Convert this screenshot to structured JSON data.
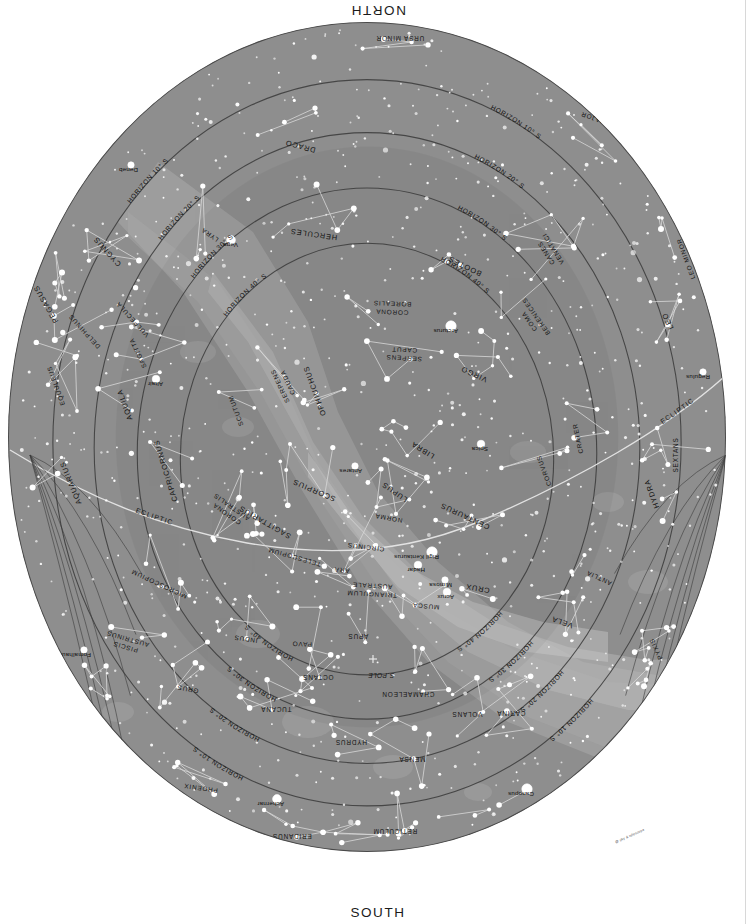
{
  "cardinals": {
    "north": "NORTH",
    "south": "SOUTH",
    "east": "EAST",
    "west": "WEST"
  },
  "credit": "@ sky & telescope",
  "colors": {
    "sky": "#8e8e8e",
    "sky_inner": "#7d7d7d",
    "milky_way": "#a9a9a9",
    "milky_way_bright": "#bdbdbd",
    "star": "#ffffff",
    "line": "#d8d8d8",
    "ring": "#3a3a3a",
    "text": "#141414",
    "background": "#ffffff"
  },
  "rings": [
    {
      "label": "HORIZON 10° S"
    },
    {
      "label": "HORIZON 20° S"
    },
    {
      "label": "HORIZON 30° S"
    },
    {
      "label": "HORIZON 40° S"
    }
  ],
  "pole": {
    "label": "S.POLE"
  },
  "ecliptic_label": "ECLIPTIC",
  "chart_data": {
    "type": "scatter",
    "projection": "azimuthal (all-sky, south pole centred)",
    "grid": "horizon altitude rings at 10°, 20°, 30°, 40° south",
    "cardinal_points": [
      "NORTH",
      "EAST",
      "SOUTH",
      "WEST"
    ],
    "horizon_rings_deg": [
      10,
      20,
      30,
      40
    ],
    "named_stars": [
      {
        "name": "Deneb",
        "x": 131,
        "y": 165,
        "mag": 1.25
      },
      {
        "name": "Vega",
        "x": 231,
        "y": 240,
        "mag": 0.03
      },
      {
        "name": "Altair",
        "x": 156,
        "y": 379,
        "mag": 0.77
      },
      {
        "name": "Arcturus",
        "x": 451,
        "y": 326,
        "mag": -0.05
      },
      {
        "name": "Regulus",
        "x": 703,
        "y": 372,
        "mag": 1.35
      },
      {
        "name": "Spica",
        "x": 481,
        "y": 444,
        "mag": 0.97
      },
      {
        "name": "Antares",
        "x": 355,
        "y": 466,
        "mag": 1.06
      },
      {
        "name": "Rigil Kentaurus",
        "x": 432,
        "y": 552,
        "mag": -0.27
      },
      {
        "name": "Hadar",
        "x": 418,
        "y": 565,
        "mag": 0.61
      },
      {
        "name": "Mimosa",
        "x": 445,
        "y": 580,
        "mag": 1.25
      },
      {
        "name": "Acrux",
        "x": 447,
        "y": 592,
        "mag": 0.77
      },
      {
        "name": "Fomalhaut",
        "x": 84,
        "y": 650,
        "mag": 1.16
      },
      {
        "name": "Achernar",
        "x": 277,
        "y": 799,
        "mag": 0.46
      },
      {
        "name": "Canopus",
        "x": 527,
        "y": 789,
        "mag": -0.74
      }
    ],
    "constellations": [
      {
        "name": "URSA MINOR",
        "x": 400,
        "y": 36,
        "rot": 180,
        "size": "sm"
      },
      {
        "name": "URSA MAJOR",
        "x": 605,
        "y": 120,
        "rot": 200,
        "size": "sm"
      },
      {
        "name": "DRACO",
        "x": 301,
        "y": 144,
        "rot": 195,
        "size": "md"
      },
      {
        "name": "CANES VENATICI",
        "x": 548,
        "y": 252,
        "rot": 238,
        "size": "sm"
      },
      {
        "name": "LEO MINOR",
        "x": 688,
        "y": 258,
        "rot": 250,
        "size": "sm"
      },
      {
        "name": "CYGNUS",
        "x": 109,
        "y": 250,
        "rot": 228,
        "size": "md"
      },
      {
        "name": "LYRA",
        "x": 211,
        "y": 233,
        "rot": 215,
        "size": "sm"
      },
      {
        "name": "HERCULES",
        "x": 314,
        "y": 232,
        "rot": 188,
        "size": "md"
      },
      {
        "name": "BOOTES",
        "x": 466,
        "y": 264,
        "rot": 206,
        "size": "md"
      },
      {
        "name": "CORONA BOREALIS",
        "x": 392,
        "y": 310,
        "rot": 182,
        "size": "sm"
      },
      {
        "name": "COMA BERENICES",
        "x": 531,
        "y": 320,
        "rot": 235,
        "size": "sm"
      },
      {
        "name": "LEO",
        "x": 670,
        "y": 320,
        "rot": 245,
        "size": "md"
      },
      {
        "name": "PEGASUS",
        "x": 48,
        "y": 303,
        "rot": 240,
        "size": "md"
      },
      {
        "name": "DELPHINUS",
        "x": 86,
        "y": 330,
        "rot": 228,
        "size": "sm"
      },
      {
        "name": "VULPECULA",
        "x": 134,
        "y": 318,
        "rot": 228,
        "size": "sm"
      },
      {
        "name": "SAGITTA",
        "x": 140,
        "y": 352,
        "rot": 245,
        "size": "sm"
      },
      {
        "name": "SERPENS CAPUT",
        "x": 404,
        "y": 356,
        "rot": 183,
        "size": "sm"
      },
      {
        "name": "OPHIUCHUS",
        "x": 317,
        "y": 390,
        "rot": 250,
        "size": "md"
      },
      {
        "name": "VIRGO",
        "x": 475,
        "y": 372,
        "rot": 205,
        "size": "md"
      },
      {
        "name": "EQUULEUS",
        "x": 58,
        "y": 385,
        "rot": 250,
        "size": "sm"
      },
      {
        "name": "AQUILA",
        "x": 127,
        "y": 404,
        "rot": 250,
        "size": "md"
      },
      {
        "name": "SCUTUM",
        "x": 238,
        "y": 410,
        "rot": 250,
        "size": "sm"
      },
      {
        "name": "SERPENS CAUDA",
        "x": 282,
        "y": 385,
        "rot": 245,
        "size": "sm"
      },
      {
        "name": "SEXTANS",
        "x": 678,
        "y": 455,
        "rot": 270,
        "size": "sm"
      },
      {
        "name": "CRATER",
        "x": 580,
        "y": 438,
        "rot": 258,
        "size": "sm"
      },
      {
        "name": "CORVUS",
        "x": 546,
        "y": 470,
        "rot": 250,
        "size": "sm"
      },
      {
        "name": "LIBRA",
        "x": 424,
        "y": 448,
        "rot": 212,
        "size": "md"
      },
      {
        "name": "LUPUS",
        "x": 396,
        "y": 490,
        "rot": 215,
        "size": "md"
      },
      {
        "name": "AQUARIUS",
        "x": 73,
        "y": 482,
        "rot": 248,
        "size": "md"
      },
      {
        "name": "CAPRICORNUS",
        "x": 168,
        "y": 470,
        "rot": 253,
        "size": "md"
      },
      {
        "name": "SCORPIUS",
        "x": 315,
        "y": 488,
        "rot": 203,
        "size": "md"
      },
      {
        "name": "NORMA",
        "x": 389,
        "y": 516,
        "rot": 190,
        "size": "sm"
      },
      {
        "name": "CENTAURUS",
        "x": 466,
        "y": 514,
        "rot": 205,
        "size": "md"
      },
      {
        "name": "HYDRA",
        "x": 654,
        "y": 493,
        "rot": 250,
        "size": "md"
      },
      {
        "name": "SAGITTARIUS",
        "x": 266,
        "y": 520,
        "rot": 210,
        "size": "md"
      },
      {
        "name": "CORONA AUSTRALIS",
        "x": 228,
        "y": 512,
        "rot": 215,
        "size": "sm"
      },
      {
        "name": "CIRCINUS",
        "x": 366,
        "y": 545,
        "rot": 187,
        "size": "sm"
      },
      {
        "name": "TELESCOPIUM",
        "x": 295,
        "y": 555,
        "rot": 196,
        "size": "sm"
      },
      {
        "name": "ARA",
        "x": 342,
        "y": 568,
        "rot": 186,
        "size": "sm"
      },
      {
        "name": "MICROSCOPIUM",
        "x": 160,
        "y": 582,
        "rot": 205,
        "size": "sm"
      },
      {
        "name": "TRIANGULUM AUSTRALE",
        "x": 372,
        "y": 592,
        "rot": 183,
        "size": "sm"
      },
      {
        "name": "MUSCA",
        "x": 426,
        "y": 604,
        "rot": 185,
        "size": "sm"
      },
      {
        "name": "CRUX",
        "x": 478,
        "y": 586,
        "rot": 190,
        "size": "md"
      },
      {
        "name": "VELA",
        "x": 563,
        "y": 620,
        "rot": 200,
        "size": "md"
      },
      {
        "name": "ANTLIA",
        "x": 600,
        "y": 576,
        "rot": 205,
        "size": "sm"
      },
      {
        "name": "APUS",
        "x": 358,
        "y": 634,
        "rot": 180,
        "size": "sm"
      },
      {
        "name": "PAVO",
        "x": 302,
        "y": 642,
        "rot": 182,
        "size": "sm"
      },
      {
        "name": "INDUS",
        "x": 246,
        "y": 637,
        "rot": 188,
        "size": "sm"
      },
      {
        "name": "OCTANS",
        "x": 318,
        "y": 675,
        "rot": 180,
        "size": "sm"
      },
      {
        "name": "CHAMAELEON",
        "x": 408,
        "y": 692,
        "rot": 180,
        "size": "sm"
      },
      {
        "name": "PYXIS",
        "x": 658,
        "y": 648,
        "rot": 245,
        "size": "sm"
      },
      {
        "name": "GRUS",
        "x": 188,
        "y": 687,
        "rot": 190,
        "size": "sm"
      },
      {
        "name": "PISCIS AUSTRINUS",
        "x": 126,
        "y": 645,
        "rot": 196,
        "size": "sm"
      },
      {
        "name": "TUCANA",
        "x": 276,
        "y": 707,
        "rot": 180,
        "size": "sm"
      },
      {
        "name": "VOLANS",
        "x": 467,
        "y": 712,
        "rot": 180,
        "size": "sm"
      },
      {
        "name": "CARINA",
        "x": 511,
        "y": 711,
        "rot": 180,
        "size": "sm"
      },
      {
        "name": "PUPPIS",
        "x": 668,
        "y": 700,
        "rot": 242,
        "size": "sm"
      },
      {
        "name": "HYDRUS",
        "x": 351,
        "y": 740,
        "rot": 180,
        "size": "sm"
      },
      {
        "name": "MENSA",
        "x": 412,
        "y": 757,
        "rot": 180,
        "size": "sm"
      },
      {
        "name": "SCULPTOR",
        "x": 93,
        "y": 715,
        "rot": 218,
        "size": "sm"
      },
      {
        "name": "PHOENIX",
        "x": 201,
        "y": 786,
        "rot": 188,
        "size": "sm"
      },
      {
        "name": "ERIDANUS",
        "x": 292,
        "y": 834,
        "rot": 180,
        "size": "sm"
      },
      {
        "name": "RETICULUM",
        "x": 395,
        "y": 829,
        "rot": 180,
        "size": "sm"
      },
      {
        "name": "DORADO",
        "x": 460,
        "y": 845,
        "rot": 180,
        "size": "sm"
      },
      {
        "name": "PICTOR",
        "x": 519,
        "y": 829,
        "rot": 180,
        "size": "sm"
      },
      {
        "name": "HOROLOGIUM",
        "x": 361,
        "y": 868,
        "rot": 180,
        "size": "sm"
      },
      {
        "name": "S.POLE",
        "x": 381,
        "y": 673,
        "rot": 180,
        "size": "sm"
      }
    ]
  }
}
